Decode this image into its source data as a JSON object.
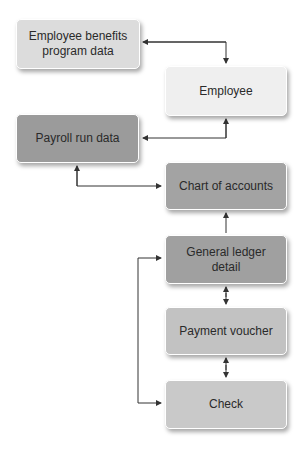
{
  "diagram": {
    "nodes": [
      {
        "id": "benefits",
        "label": "Employee benefits program data",
        "line1": "Employee benefits",
        "line2": "program data",
        "fill": "#dcdcdc"
      },
      {
        "id": "employee",
        "label": "Employee",
        "fill": "#efefef"
      },
      {
        "id": "payroll",
        "label": "Payroll run data",
        "fill": "#9b9b9b"
      },
      {
        "id": "chart",
        "label": "Chart of accounts",
        "fill": "#a3a3a3"
      },
      {
        "id": "ledger",
        "label": "General ledger detail",
        "line1": "General ledger",
        "line2": "detail",
        "fill": "#a0a0a0"
      },
      {
        "id": "voucher",
        "label": "Payment voucher",
        "fill": "#c2c2c2"
      },
      {
        "id": "check",
        "label": "Check",
        "fill": "#c9c9c9"
      }
    ],
    "edges": [
      {
        "from": "benefits",
        "to": "employee",
        "bidirectional": true
      },
      {
        "from": "payroll",
        "to": "employee",
        "bidirectional": true
      },
      {
        "from": "payroll",
        "to": "chart",
        "bidirectional": true
      },
      {
        "from": "ledger",
        "to": "chart",
        "bidirectional": false
      },
      {
        "from": "ledger",
        "to": "voucher",
        "bidirectional": true
      },
      {
        "from": "voucher",
        "to": "check",
        "bidirectional": true
      },
      {
        "from": "check",
        "to": "ledger",
        "bidirectional": true
      }
    ],
    "colors": {
      "line": "#333333",
      "text": "#2a2a2a"
    }
  }
}
